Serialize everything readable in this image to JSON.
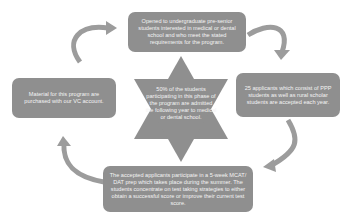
{
  "diagram": {
    "type": "cycle",
    "colors": {
      "shape_fill": "#8f8f8f",
      "arrow": "#9a9a9a",
      "text": "#f4f4f4",
      "background": "#ffffff"
    },
    "center": {
      "shape": "six-pointed-star",
      "text": "50% of the students participating in this phase of the program are admitted the following year to medical or dental school."
    },
    "steps": [
      {
        "id": "top",
        "text": "Opened to undergraduate pre-senior students interested in medical or dental school and who meet the stated requirements for the program."
      },
      {
        "id": "right",
        "text": "25 applicants which consist of PPP students as well as rural scholar students are accepted each year."
      },
      {
        "id": "bottom",
        "text": "The accepted applicants participate in a 5-week MCAT/ DAT prep which takes place during the summer. The students concentrate on test taking strategies to either obtain a successful score or improve their current test score."
      },
      {
        "id": "left",
        "text": "Material for this program are purchased with our VC account."
      }
    ],
    "arrows": [
      {
        "from": "top",
        "to": "right",
        "direction": "clockwise"
      },
      {
        "from": "right",
        "to": "bottom",
        "direction": "clockwise"
      },
      {
        "from": "bottom",
        "to": "left",
        "direction": "clockwise"
      },
      {
        "from": "left",
        "to": "top",
        "direction": "clockwise"
      }
    ]
  }
}
